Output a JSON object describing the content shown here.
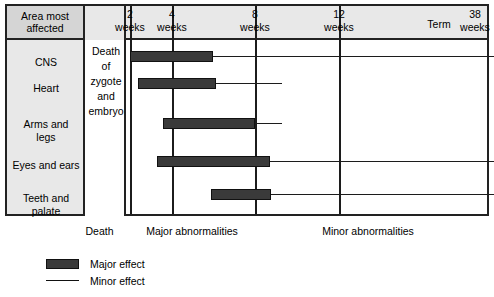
{
  "table": {
    "corner_label_line1": "Area most",
    "corner_label_line2": "affected",
    "death_zone_text": "Death of zygote and embryo",
    "death_zone_lines": [
      "Death",
      "of",
      "zygote",
      "and",
      "embryo"
    ]
  },
  "legend": {
    "major_label": "Major effect",
    "minor_label": "Minor effect",
    "major_icon": "filled-bar-icon",
    "minor_icon": "thin-line-icon"
  },
  "zone_captions": [
    {
      "label": "Death",
      "x": 79,
      "width": 41
    },
    {
      "label": "Major abnormalities",
      "x": 122,
      "width": 140
    },
    {
      "label": "Minor abnormalities",
      "x": 278,
      "width": 180
    }
  ],
  "colors": {
    "major_effect": "#3a3a3a",
    "minor_effect": "#1c1c1c",
    "header_background": "#e8e8e8",
    "corner_background": "#d5d5d5",
    "frame_border": "#222222",
    "page_background": "#ffffff"
  },
  "chart_data": {
    "type": "bar",
    "xlabel": "Weeks of gestation",
    "ylabel": "Area most affected",
    "xlim": [
      0,
      38
    ],
    "grid": true,
    "legend_position": "bottom-left",
    "orientation": "horizontal",
    "axis_ticks": [
      {
        "value": 2,
        "number": "2",
        "unit": "weeks",
        "gridline": true,
        "x_px": 125
      },
      {
        "value": 4,
        "number": "4",
        "unit": "weeks",
        "gridline": true,
        "x_px": 167
      },
      {
        "value": 8,
        "number": "8",
        "unit": "weeks",
        "gridline": true,
        "x_px": 250
      },
      {
        "value": 12,
        "number": "12",
        "unit": "weeks",
        "gridline": true,
        "x_px": 334
      },
      {
        "value": 36,
        "number": "Term",
        "unit": "",
        "gridline": false,
        "x_px": 434
      },
      {
        "value": 38,
        "number": "38",
        "unit": "weeks",
        "gridline": false,
        "x_px": 470
      }
    ],
    "categories": [
      "CNS",
      "Heart",
      "Arms and legs",
      "Eyes and ears",
      "Teeth and palate"
    ],
    "series": [
      {
        "name": "Major effect",
        "type": "range-bar",
        "color": "#3a3a3a",
        "values": [
          {
            "category": "CNS",
            "start_weeks": 3.0,
            "end_weeks": 6.0
          },
          {
            "category": "Heart",
            "start_weeks": 3.4,
            "end_weeks": 6.1
          },
          {
            "category": "Arms and legs",
            "start_weeks": 4.5,
            "end_weeks": 8.0
          },
          {
            "category": "Eyes and ears",
            "start_weeks": 4.2,
            "end_weeks": 8.7
          },
          {
            "category": "Teeth and palate",
            "start_weeks": 6.8,
            "end_weeks": 8.8
          }
        ]
      },
      {
        "name": "Minor effect",
        "type": "range-line",
        "color": "#1c1c1c",
        "values": [
          {
            "category": "CNS",
            "start_weeks": 6.0,
            "end_weeks": 38.0
          },
          {
            "category": "Heart",
            "start_weeks": 6.1,
            "end_weeks": 9.3
          },
          {
            "category": "Arms and legs",
            "start_weeks": 8.0,
            "end_weeks": 9.3
          },
          {
            "category": "Eyes and ears",
            "start_weeks": 8.7,
            "end_weeks": 38.0
          },
          {
            "category": "Teeth and palate",
            "start_weeks": 8.8,
            "end_weeks": 38.0
          }
        ]
      }
    ],
    "rows_px": [
      {
        "category": "CNS",
        "label_lines": [
          "CNS"
        ],
        "label_top": 50,
        "bar_top": 45,
        "bar_left": 125,
        "bar_right": 208,
        "minor_right": 489,
        "divider_top": 50
      },
      {
        "category": "Heart",
        "label_lines": [
          "Heart"
        ],
        "label_top": 76,
        "bar_top": 72,
        "bar_left": 133,
        "bar_right": 211,
        "minor_right": 277,
        "divider_top": 77
      },
      {
        "category": "Arms and legs",
        "label_lines": [
          "Arms and",
          "legs"
        ],
        "label_top": 112,
        "bar_top": 112,
        "bar_left": 158,
        "bar_right": 250,
        "minor_right": 277,
        "divider_top": 117
      },
      {
        "category": "Eyes and ears",
        "label_lines": [
          "Eyes and ears"
        ],
        "label_top": 153,
        "bar_top": 150,
        "bar_left": 152,
        "bar_right": 265,
        "minor_right": 489,
        "divider_top": 155
      },
      {
        "category": "Teeth and palate",
        "label_lines": [
          "Teeth and",
          "palate"
        ],
        "label_top": 186,
        "bar_top": 183,
        "bar_left": 206,
        "bar_right": 266,
        "minor_right": 489,
        "divider_top": 188
      }
    ]
  }
}
